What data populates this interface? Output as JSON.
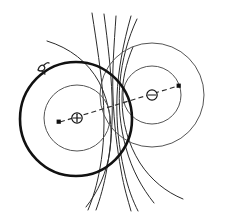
{
  "figure": {
    "title": "Electric dipole field and equipotential diagram",
    "background_color": "#ffffff",
    "width": 236,
    "height": 213,
    "line_color": "#2b2b2b",
    "thick_line_color": "#111111",
    "thin_line_color": "#555555"
  },
  "charges": [
    {
      "id": "positive-charge",
      "sign": "+",
      "label": "+",
      "cx": 77,
      "cy": 118,
      "r": 5.2,
      "ring_count": 2,
      "rings": [
        {
          "name": "inner-equipotential-left",
          "rx": 33,
          "ry": 33,
          "weight": "thin"
        },
        {
          "name": "outer-equipotential-left",
          "rx": 56,
          "ry": 57,
          "weight": "thick"
        }
      ]
    },
    {
      "id": "negative-charge",
      "sign": "−",
      "label": "−",
      "cx": 152,
      "cy": 95,
      "r": 5.2,
      "ring_count": 2,
      "rings": [
        {
          "name": "inner-equipotential-right",
          "rx": 29,
          "ry": 29,
          "weight": "thin"
        },
        {
          "name": "outer-equipotential-right",
          "rx": 52,
          "ry": 52,
          "weight": "thin"
        }
      ]
    }
  ],
  "dipole_axis": {
    "name": "dipole-axis",
    "style": "dashed",
    "start_dot": {
      "x": 59,
      "y": 122
    },
    "end_dot": {
      "x": 179,
      "y": 86
    },
    "passes_through": [
      "positive-charge",
      "negative-charge"
    ]
  },
  "field_lines": {
    "count": 7,
    "description": "Curved electric field lines sweeping from the positive charge region toward the negative charge region"
  },
  "annotation": {
    "name": "pencil-mark-annotation",
    "x": 40,
    "y": 66,
    "text": ""
  },
  "chart_data": {
    "type": "scatter",
    "title": "Electric dipole field and equipotential diagram",
    "xlabel": "",
    "ylabel": "",
    "legend": [],
    "series": [
      {
        "name": "charges",
        "points": [
          {
            "label": "+",
            "x": 77,
            "y": 118
          },
          {
            "label": "−",
            "x": 152,
            "y": 95
          }
        ]
      }
    ]
  }
}
